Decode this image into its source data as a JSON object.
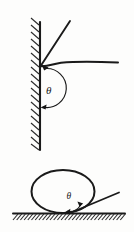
{
  "figure": {
    "background_color": "#fdfdfc",
    "ink_color": "#1a1a1a",
    "width": 134,
    "height": 232,
    "panels": [
      {
        "id": "top-panel",
        "name": "meniscus-at-vertical-wall",
        "description": "Liquid meniscus meeting a vertical hatched solid wall; contact angle theta measured from the wall surface through the liquid to the liquid surface tangent.",
        "angle_label": "θ",
        "angle_label_x": 46,
        "angle_label_y": 90,
        "wall": {
          "name": "vertical-wall",
          "x": 40,
          "y_top": 22,
          "y_bottom": 150,
          "hatch_side": "left",
          "hatch_count": 18,
          "hatch_length": 9,
          "line_width": 2.1
        },
        "tangent_line": {
          "name": "surface-tangent-line",
          "x1": 70,
          "y1": 21,
          "x2": 40.5,
          "y2": 66,
          "line_width": 1.9
        },
        "interface_curve": {
          "name": "liquid-surface-curve",
          "path": "M 40.5 66 C 48 66.5 54 63.5 62 62.6 C 80 61 100 61.6 118 62.4",
          "line_width": 2.0
        },
        "angle_arc": {
          "name": "theta-arc",
          "path": "M 44.5 67.5 A 19 19 0 1 1 42.5 107.5",
          "line_width": 1.2,
          "arrow_tip_x": 41.0,
          "arrow_tip_y": 107.9,
          "arrow_direction": "left"
        }
      },
      {
        "id": "bottom-panel",
        "name": "sessile-droplet-on-surface",
        "description": "Liquid droplet resting on a horizontal hatched solid surface; contact angle theta between the substrate and the droplet tangent at the contact point.",
        "angle_label": "θ",
        "angle_label_x": 70,
        "angle_label_y": 197,
        "substrate": {
          "name": "horizontal-substrate",
          "y": 213.5,
          "x_left": 13,
          "x_right": 125,
          "hatch_side": "below",
          "hatch_count": 30,
          "hatch_length": 7,
          "line_width": 2.0
        },
        "droplet": {
          "name": "droplet-outline",
          "cx": 63,
          "cy": 191,
          "rx": 32,
          "ry": 22,
          "line_width": 2.0
        },
        "tangent_line": {
          "name": "droplet-tangent-line",
          "x1": 71,
          "y1": 212.5,
          "x2": 119,
          "y2": 193,
          "line_width": 1.8
        },
        "angle_arc": {
          "name": "theta-arc",
          "path": "M 79 205.5 A 13 13 0 0 1 66.5 211.5",
          "line_width": 1.2,
          "arrow_tip_a_x": 65.2,
          "arrow_tip_a_y": 211.8,
          "arrow_tip_b_x": 80.4,
          "arrow_tip_b_y": 204.3
        }
      }
    ]
  }
}
